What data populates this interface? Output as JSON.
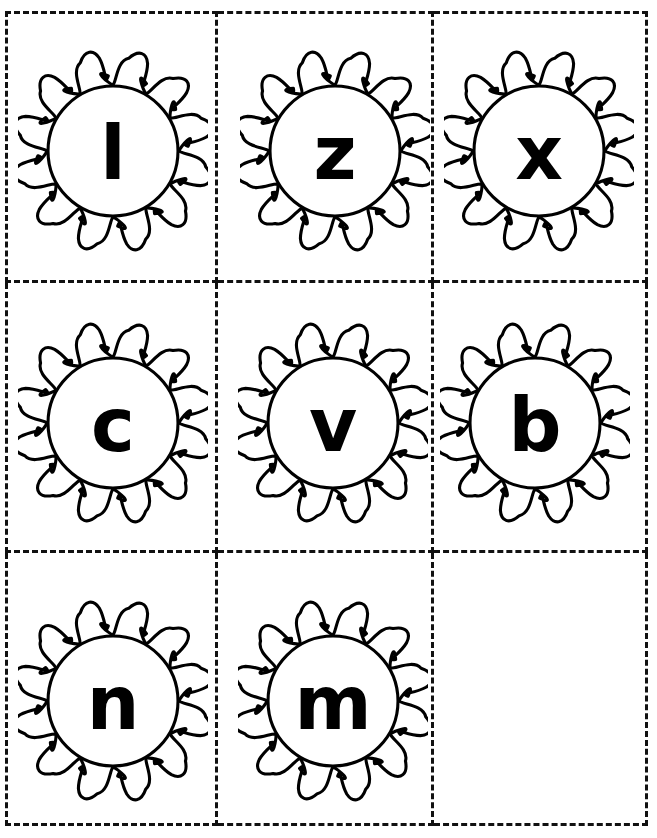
{
  "page": {
    "width": 657,
    "height": 838,
    "background_color": "#ffffff",
    "ink_color": "#000000",
    "cut_line_style": "dashed",
    "cut_line_color": "#111111",
    "columns": 3,
    "rows": 3
  },
  "cards": [
    {
      "row": 1,
      "col": 1,
      "letter": "l",
      "icon": "sun-icon",
      "weight": "heavy",
      "empty": false
    },
    {
      "row": 1,
      "col": 2,
      "letter": "z",
      "icon": "sun-icon",
      "weight": "heavy",
      "empty": false
    },
    {
      "row": 1,
      "col": 3,
      "letter": "x",
      "icon": "sun-icon",
      "weight": "heavy",
      "empty": false
    },
    {
      "row": 2,
      "col": 1,
      "letter": "c",
      "icon": "sun-icon",
      "weight": "heavy",
      "empty": false
    },
    {
      "row": 2,
      "col": 2,
      "letter": "v",
      "icon": "sun-icon",
      "weight": "heavy",
      "empty": false
    },
    {
      "row": 2,
      "col": 3,
      "letter": "b",
      "icon": "sun-icon",
      "weight": "heavy",
      "empty": false
    },
    {
      "row": 3,
      "col": 1,
      "letter": "n",
      "icon": "sun-icon",
      "weight": "normal",
      "empty": false
    },
    {
      "row": 3,
      "col": 2,
      "letter": "m",
      "icon": "sun-icon",
      "weight": "normal",
      "empty": false
    },
    {
      "row": 3,
      "col": 3,
      "letter": "",
      "icon": "",
      "weight": "normal",
      "empty": true
    }
  ]
}
